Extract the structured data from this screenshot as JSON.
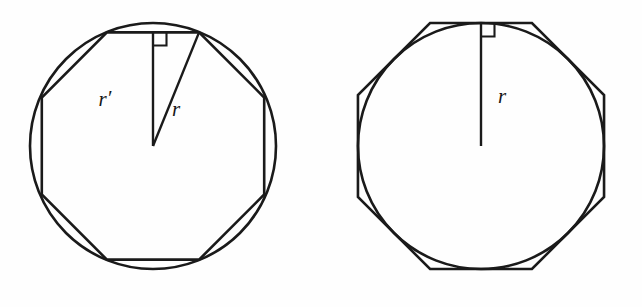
{
  "figure": {
    "background_color": "#fefefe",
    "stroke_color": "#1a1a1a",
    "panels": [
      {
        "name": "left-panel",
        "caption": "Circle with inscribed regular octagon",
        "circle": {
          "cx": 153,
          "cy": 146,
          "r": 123
        },
        "octagon": {
          "type": "inscribed",
          "sides": 8,
          "circumradius": 123,
          "rotation_deg": 22.5,
          "vertex_count": 8
        },
        "radius_line": {
          "name": "apothem",
          "label": "r′",
          "from": [
            153,
            146
          ],
          "to": [
            153,
            32
          ]
        },
        "slant_line": {
          "name": "circumradius",
          "label": "r",
          "from": [
            153,
            146
          ],
          "to": [
            200,
            32
          ]
        },
        "right_angle_marker": {
          "x": 156,
          "y": 32,
          "size": 13
        },
        "labels": [
          {
            "name": "apothem-label",
            "text": "r",
            "prime": "′",
            "x": 108,
            "y": 103
          },
          {
            "name": "radius-label",
            "text": "r",
            "prime": "",
            "x": 171,
            "y": 113
          }
        ]
      },
      {
        "name": "right-panel",
        "caption": "Circle with circumscribed regular octagon",
        "circle": {
          "cx": 481,
          "cy": 146,
          "r": 123
        },
        "octagon": {
          "type": "circumscribed",
          "sides": 8,
          "inradius": 123,
          "rotation_deg": 22.5,
          "vertex_count": 8
        },
        "radius_line": {
          "name": "radius",
          "label": "r",
          "from": [
            481,
            146
          ],
          "to": [
            481,
            23
          ]
        },
        "right_angle_marker": {
          "x": 484,
          "y": 23,
          "size": 13
        },
        "labels": [
          {
            "name": "radius-label",
            "text": "r",
            "prime": "",
            "x": 497,
            "y": 100
          }
        ]
      }
    ]
  },
  "annotations": {
    "r_prime_symbol": "r′",
    "r_symbol": "r",
    "right_angle_symbol": "∟"
  }
}
